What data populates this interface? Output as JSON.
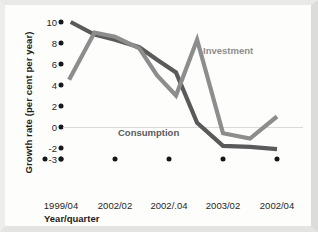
{
  "chart_data": {
    "type": "line",
    "title": "",
    "xlabel": "Year/quarter",
    "ylabel": "Growth rate (per cent per year)",
    "ylim": [
      -3,
      10
    ],
    "y_ticks": [
      10,
      8,
      6,
      4,
      2,
      0,
      -2,
      -3
    ],
    "y_tick_labels": [
      "10",
      "8",
      "6",
      "4",
      "2",
      "0",
      "-2",
      "-3"
    ],
    "categories": [
      "1999/04",
      "2002/02",
      "2002/.04",
      "2003/02",
      "2002/04"
    ],
    "grid": false,
    "zero_line": true,
    "legend_position": "inline-annotations",
    "series": [
      {
        "name": "Consumption",
        "color": "#5a5a5a",
        "x": [
          0.18,
          0.62,
          1.0,
          1.45,
          1.78,
          2.13,
          2.52,
          3.0,
          3.5,
          4.0
        ],
        "values": [
          10.0,
          8.8,
          8.3,
          7.6,
          6.4,
          5.2,
          0.4,
          -1.8,
          -1.9,
          -2.1
        ]
      },
      {
        "name": "Investment",
        "color": "#8d8d8d",
        "x": [
          0.15,
          0.62,
          1.0,
          1.45,
          1.78,
          2.13,
          2.52,
          3.0,
          3.5,
          4.0
        ],
        "values": [
          4.5,
          9.0,
          8.6,
          7.5,
          4.9,
          3.0,
          8.3,
          -0.6,
          -1.1,
          1.0
        ]
      }
    ]
  },
  "annotations": {
    "investment_label": "Investment",
    "consumption_label": "Consumption"
  }
}
